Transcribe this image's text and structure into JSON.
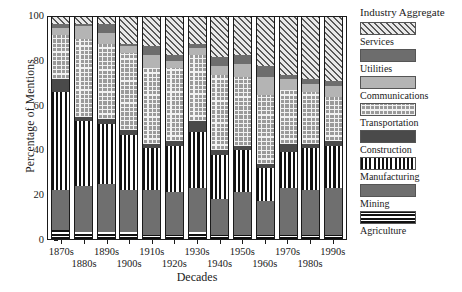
{
  "chart_data": {
    "type": "bar",
    "subtype": "stacked-percentage",
    "title": "",
    "xlabel": "Decades",
    "ylabel": "Percentage of Mentions",
    "ylim": [
      0,
      100
    ],
    "yticks": [
      0,
      20,
      40,
      60,
      80,
      100
    ],
    "ytick_labels": [
      "0",
      "20",
      "40",
      "60",
      "80",
      "100"
    ],
    "grid": false,
    "legend_position": "right",
    "legend_title": "Industry Aggregate",
    "categories": [
      "1870s",
      "1880s",
      "1890s",
      "1900s",
      "1910s",
      "1920s",
      "1930s",
      "1940s",
      "1950s",
      "1960s",
      "1970s",
      "1980s",
      "1990s"
    ],
    "series": [
      {
        "name": "Agriculture",
        "pattern": "horizontal-stripes",
        "color": "#111111",
        "values": [
          4,
          3,
          3,
          3,
          2,
          2,
          3,
          2,
          2,
          2,
          2,
          2,
          2
        ]
      },
      {
        "name": "Mining",
        "pattern": "solid-gray",
        "color": "#6f6f6f",
        "values": [
          18,
          21,
          22,
          19,
          20,
          19,
          20,
          16,
          19,
          15,
          21,
          20,
          21
        ]
      },
      {
        "name": "Manufacturing",
        "pattern": "vertical-bars",
        "color": "#111111",
        "values": [
          44,
          29,
          27,
          25,
          19,
          21,
          25,
          20,
          19,
          15,
          16,
          19,
          19
        ]
      },
      {
        "name": "Construction",
        "pattern": "solid-dark-gray",
        "color": "#4a4a4a",
        "values": [
          6,
          2,
          2,
          2,
          2,
          2,
          5,
          2,
          2,
          2,
          4,
          2,
          2
        ]
      },
      {
        "name": "Transportation",
        "pattern": "grid",
        "color": "#9a9a9a",
        "values": [
          20,
          35,
          34,
          35,
          34,
          33,
          30,
          34,
          31,
          31,
          24,
          23,
          20
        ]
      },
      {
        "name": "Communications",
        "pattern": "solid-light-gray",
        "color": "#b4b4b4",
        "values": [
          3,
          6,
          5,
          3,
          6,
          3,
          3,
          4,
          6,
          8,
          5,
          4,
          5
        ]
      },
      {
        "name": "Utilities",
        "pattern": "solid-medium-gray",
        "color": "#6d6d6d",
        "values": [
          2,
          1,
          4,
          1,
          4,
          3,
          2,
          4,
          4,
          5,
          2,
          2,
          2
        ]
      },
      {
        "name": "Services",
        "pattern": "diagonal-hatch",
        "color": "#5a5a5a",
        "values": [
          3,
          3,
          3,
          12,
          13,
          17,
          12,
          18,
          17,
          22,
          26,
          28,
          29
        ]
      }
    ]
  },
  "axes": {
    "ylabel": "Percentage of Mentions",
    "xlabel": "Decades"
  },
  "legend": {
    "title": "Industry Aggregate",
    "items": [
      {
        "label": "Services"
      },
      {
        "label": "Utilities"
      },
      {
        "label": "Communications"
      },
      {
        "label": "Transportation"
      },
      {
        "label": "Construction"
      },
      {
        "label": "Manufacturing"
      },
      {
        "label": "Mining"
      },
      {
        "label": "Agriculture"
      }
    ]
  }
}
